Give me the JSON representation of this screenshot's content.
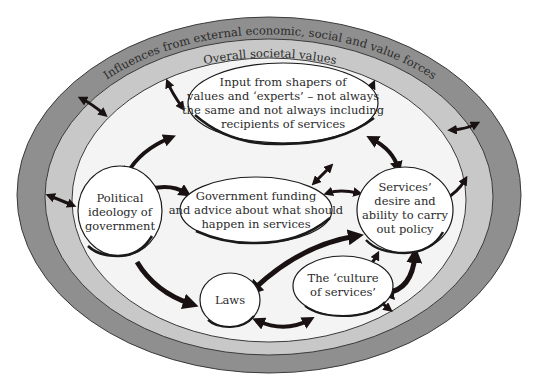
{
  "diagram": {
    "type": "nested-ellipse-influence-diagram",
    "colors": {
      "outer_ring": "#8f8f8f",
      "middle_ring": "#c8c8c8",
      "inner_area": "#f4f4f4",
      "node_fill": "#ffffff",
      "node_stroke": "#1a1a1a",
      "arrow": "#1a1212"
    },
    "rings": {
      "outer": {
        "label": "Influences from external economic, social and value forces"
      },
      "middle": {
        "label": "Overall societal values"
      }
    },
    "nodes": {
      "shapers": {
        "lines": [
          "Input from shapers of",
          "values and ‘experts’ – not always",
          "the same and not always including",
          "recipients of services"
        ]
      },
      "ideology": {
        "lines": [
          "Political",
          "ideology of",
          "government"
        ]
      },
      "funding": {
        "lines": [
          "Government funding",
          "and advice about what should",
          "happen in services"
        ]
      },
      "services": {
        "lines": [
          "Services’",
          "desire and",
          "ability to carry",
          "out policy"
        ]
      },
      "laws": {
        "lines": [
          "Laws"
        ]
      },
      "culture": {
        "lines": [
          "The ‘culture",
          "of services’"
        ]
      }
    },
    "edges": [
      {
        "from": "outer_ring",
        "to": "shapers",
        "direction": "both"
      },
      {
        "from": "outer_ring",
        "to": "services",
        "direction": "both"
      },
      {
        "from": "outer_ring",
        "to": "ideology",
        "direction": "both"
      },
      {
        "from": "outer_ring",
        "to": "culture",
        "direction": "both"
      },
      {
        "from": "middle_ring",
        "to": "inner_area",
        "direction": "both"
      },
      {
        "from": "shapers",
        "to": "ideology",
        "direction": "both"
      },
      {
        "from": "shapers",
        "to": "services",
        "direction": "both"
      },
      {
        "from": "shapers",
        "to": "funding",
        "direction": "both"
      },
      {
        "from": "ideology",
        "to": "funding",
        "direction": "forward"
      },
      {
        "from": "ideology",
        "to": "laws",
        "direction": "forward"
      },
      {
        "from": "funding",
        "to": "services",
        "direction": "both"
      },
      {
        "from": "services",
        "to": "laws",
        "direction": "both"
      },
      {
        "from": "services",
        "to": "culture",
        "direction": "both"
      },
      {
        "from": "laws",
        "to": "culture",
        "direction": "both"
      }
    ]
  }
}
